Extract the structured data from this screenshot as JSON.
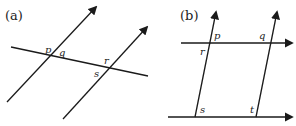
{
  "panels": [
    {
      "id": "a",
      "label": "(a)",
      "points": {
        "p": "p",
        "q": "q",
        "r": "r",
        "s": "s"
      }
    },
    {
      "id": "b",
      "label": "(b)",
      "points": {
        "p": "p",
        "q": "q",
        "r": "r",
        "s": "s",
        "t": "t"
      }
    }
  ],
  "colors": {
    "line": "#1a1a1a",
    "background": "#ffffff"
  }
}
